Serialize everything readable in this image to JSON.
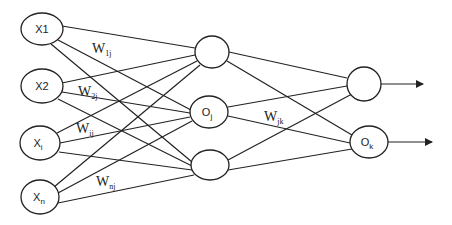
{
  "diagram": {
    "type": "neural-network",
    "layers": {
      "input": [
        {
          "id": "x1",
          "label": "X1",
          "sub": ""
        },
        {
          "id": "x2",
          "label": "X2",
          "sub": ""
        },
        {
          "id": "xi",
          "label": "X",
          "sub": "i"
        },
        {
          "id": "xn",
          "label": "X",
          "sub": "n"
        }
      ],
      "hidden": [
        {
          "id": "h1",
          "label": "",
          "sub": ""
        },
        {
          "id": "oj",
          "label": "O",
          "sub": "j"
        },
        {
          "id": "h3",
          "label": "",
          "sub": ""
        }
      ],
      "output": [
        {
          "id": "o1",
          "label": "",
          "sub": ""
        },
        {
          "id": "ok",
          "label": "O",
          "sub": "k"
        }
      ]
    },
    "weights": [
      {
        "id": "w1j",
        "label": "W",
        "sub": "1j"
      },
      {
        "id": "w2j",
        "label": "W",
        "sub": "2j"
      },
      {
        "id": "wij",
        "label": "W",
        "sub": "ij"
      },
      {
        "id": "wnj",
        "label": "W",
        "sub": "nj"
      },
      {
        "id": "wjk",
        "label": "W",
        "sub": "jk"
      }
    ],
    "connections": "fully-connected input->hidden, hidden->output",
    "outputs": [
      "arrow-out-1",
      "arrow-out-k"
    ]
  }
}
